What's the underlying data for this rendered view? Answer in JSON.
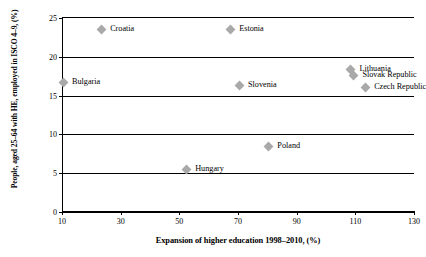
{
  "chart_data": {
    "type": "scatter",
    "title": "",
    "xlabel": "Expansion of higher education 1998–2010, (%)",
    "ylabel": "People, aged 25–64 with HE, employed in ISCO 4–9, (%)",
    "xlim": [
      10,
      130
    ],
    "ylim": [
      0,
      25
    ],
    "xticks": [
      10,
      30,
      50,
      70,
      90,
      110,
      130
    ],
    "yticks": [
      0,
      5,
      10,
      15,
      20,
      25
    ],
    "xtick_labels": [
      "10",
      "30",
      "50",
      "70",
      "90",
      "110",
      "130"
    ],
    "ytick_labels": [
      "0",
      "5",
      "10",
      "15",
      "20",
      "25"
    ],
    "grid": "horizontal",
    "legend": "none",
    "marker_color": "#a9a9a9",
    "marker_shape": "diamond",
    "points": [
      {
        "label": "Croatia",
        "x": 23,
        "y": 23.5
      },
      {
        "label": "Estonia",
        "x": 67,
        "y": 23.5
      },
      {
        "label": "Bulgaria",
        "x": 10,
        "y": 16.7
      },
      {
        "label": "Slovenia",
        "x": 70,
        "y": 16.3
      },
      {
        "label": "Lithuania",
        "x": 108,
        "y": 18.4
      },
      {
        "label": "Slovak Republic",
        "x": 109,
        "y": 17.6
      },
      {
        "label": "Czech Republic",
        "x": 113,
        "y": 16.1
      },
      {
        "label": "Poland",
        "x": 80,
        "y": 8.5
      },
      {
        "label": "Hungary",
        "x": 52,
        "y": 5.5
      }
    ]
  }
}
